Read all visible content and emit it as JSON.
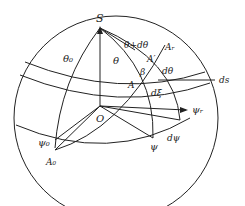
{
  "diagram": {
    "labels": {
      "S": "S",
      "O": "O",
      "theta0": "θ₀",
      "theta": "θ",
      "theta_plus_dtheta": "θ+dθ",
      "A_r": "Aᵣ",
      "A_prime": "A′",
      "A": "A",
      "beta": "β",
      "dtheta": "dθ",
      "ds": "ds",
      "dxi": "dξ",
      "psi_r": "ψᵣ",
      "psi": "ψ",
      "dpsi": "dψ",
      "psi0": "ψ₀",
      "A0": "A₀"
    },
    "colors": {
      "stroke": "#222222",
      "background": "#ffffff"
    }
  }
}
